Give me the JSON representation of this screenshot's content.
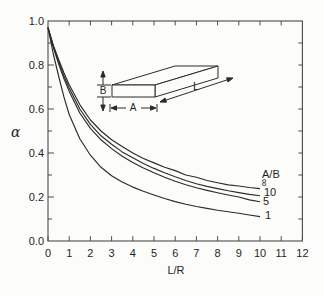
{
  "figure": {
    "background": "#fcfcfa",
    "ink": "#2b2b2b",
    "frame_ink": "#4a4a4a"
  },
  "axes": {
    "y_label": "α",
    "x_label": "L/R",
    "y_tick_labels": [
      "1.0",
      "0.8",
      "0.6",
      "0.4",
      "0.2",
      "0.0"
    ],
    "y_tick_values": [
      1.0,
      0.8,
      0.6,
      0.4,
      0.2,
      0.0
    ],
    "x_tick_labels": [
      "0",
      "1",
      "2",
      "3",
      "4",
      "5",
      "6",
      "7",
      "8",
      "9",
      "10",
      "11",
      "12"
    ],
    "x_range": [
      0,
      12
    ],
    "y_range": [
      0,
      1.0
    ]
  },
  "legend": {
    "header": "A/B",
    "entries": [
      "∞",
      "10",
      "5",
      "1"
    ]
  },
  "inset": {
    "labels": {
      "height": "B",
      "width": "A",
      "length": "L"
    }
  },
  "chart_data": {
    "type": "line",
    "title": "",
    "xlabel": "L/R",
    "ylabel": "α",
    "xlim": [
      0,
      12
    ],
    "ylim": [
      0,
      1.0
    ],
    "grid": false,
    "legend_position": "right-of-curve-ends",
    "x": [
      0,
      0.25,
      0.5,
      0.75,
      1,
      1.5,
      2,
      2.5,
      3,
      3.5,
      4,
      4.5,
      5,
      5.5,
      6,
      6.5,
      7,
      7.5,
      8,
      8.5,
      9,
      9.5,
      10
    ],
    "series": [
      {
        "name": "A/B = ∞",
        "id": "curve-ab-infinity",
        "values": [
          0.97,
          0.89,
          0.825,
          0.765,
          0.71,
          0.62,
          0.55,
          0.5,
          0.46,
          0.43,
          0.4,
          0.375,
          0.355,
          0.335,
          0.32,
          0.3,
          0.29,
          0.275,
          0.265,
          0.255,
          0.25,
          0.243,
          0.238
        ]
      },
      {
        "name": "A/B = 10",
        "id": "curve-ab-10",
        "values": [
          0.97,
          0.885,
          0.815,
          0.75,
          0.695,
          0.6,
          0.53,
          0.478,
          0.44,
          0.405,
          0.378,
          0.352,
          0.33,
          0.31,
          0.292,
          0.275,
          0.26,
          0.248,
          0.238,
          0.228,
          0.22,
          0.212,
          0.206
        ]
      },
      {
        "name": "A/B = 5",
        "id": "curve-ab-5",
        "values": [
          0.97,
          0.88,
          0.805,
          0.738,
          0.68,
          0.582,
          0.512,
          0.46,
          0.42,
          0.385,
          0.357,
          0.332,
          0.31,
          0.29,
          0.272,
          0.256,
          0.242,
          0.23,
          0.219,
          0.209,
          0.2,
          0.187,
          0.178
        ]
      },
      {
        "name": "A/B = 1",
        "id": "curve-ab-1",
        "values": [
          0.97,
          0.85,
          0.75,
          0.655,
          0.575,
          0.465,
          0.39,
          0.335,
          0.297,
          0.268,
          0.245,
          0.226,
          0.209,
          0.193,
          0.179,
          0.167,
          0.157,
          0.148,
          0.14,
          0.133,
          0.126,
          0.118,
          0.111
        ]
      }
    ]
  }
}
